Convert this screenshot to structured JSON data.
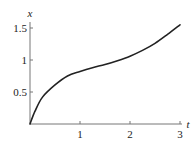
{
  "chart_data": {
    "type": "line",
    "title": "",
    "xlabel": "t",
    "ylabel": "x",
    "xlim": [
      0,
      3
    ],
    "ylim": [
      0,
      1.6
    ],
    "grid": false,
    "x_ticks": [
      "1",
      "2",
      "3"
    ],
    "y_ticks": [
      "0.5",
      "1",
      "1.5"
    ],
    "series": [
      {
        "name": "x(t)",
        "x": [
          0,
          0.1,
          0.25,
          0.5,
          0.75,
          1.0,
          1.25,
          1.5,
          1.75,
          2.0,
          2.25,
          2.5,
          2.75,
          3.0
        ],
        "values": [
          0,
          0.2,
          0.42,
          0.61,
          0.75,
          0.82,
          0.88,
          0.93,
          0.99,
          1.06,
          1.15,
          1.26,
          1.4,
          1.55
        ]
      }
    ],
    "line_color": "#222222"
  },
  "axes": {
    "x_label": "t",
    "y_label": "x",
    "x_tick_labels": [
      "1",
      "2",
      "3"
    ],
    "y_tick_labels": [
      "0.5",
      "1",
      "1.5"
    ]
  }
}
